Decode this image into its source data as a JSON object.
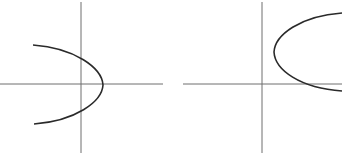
{
  "figure": {
    "background": "#ffffff",
    "axis_color": "#6f6f6f",
    "curve_color": "#2a2a2a",
    "panels": [
      {
        "id": "left",
        "description": "Parabola opening to the left, vertex on positive x-axis, crossing the y-axis above and below the origin",
        "x_axis": {
          "x1": 0,
          "y1": 84,
          "x2": 163,
          "y2": 84
        },
        "y_axis": {
          "x1": 81,
          "y1": 2,
          "x2": 81,
          "y2": 153
        },
        "curve_path": "M 33 45 C 75 48, 102 68, 103 85 C 102 102, 75 121, 34 124"
      },
      {
        "id": "right",
        "description": "Parabola opening to the right, vertex in first quadrant, lower arm crossing the x-axis",
        "x_axis": {
          "x1": 183,
          "y1": 84,
          "x2": 342,
          "y2": 84
        },
        "y_axis": {
          "x1": 262,
          "y1": 2,
          "x2": 262,
          "y2": 153
        },
        "curve_path": "M 342 13 C 300 16, 275 35, 274 52 C 275 70, 300 88, 342 91"
      }
    ]
  }
}
